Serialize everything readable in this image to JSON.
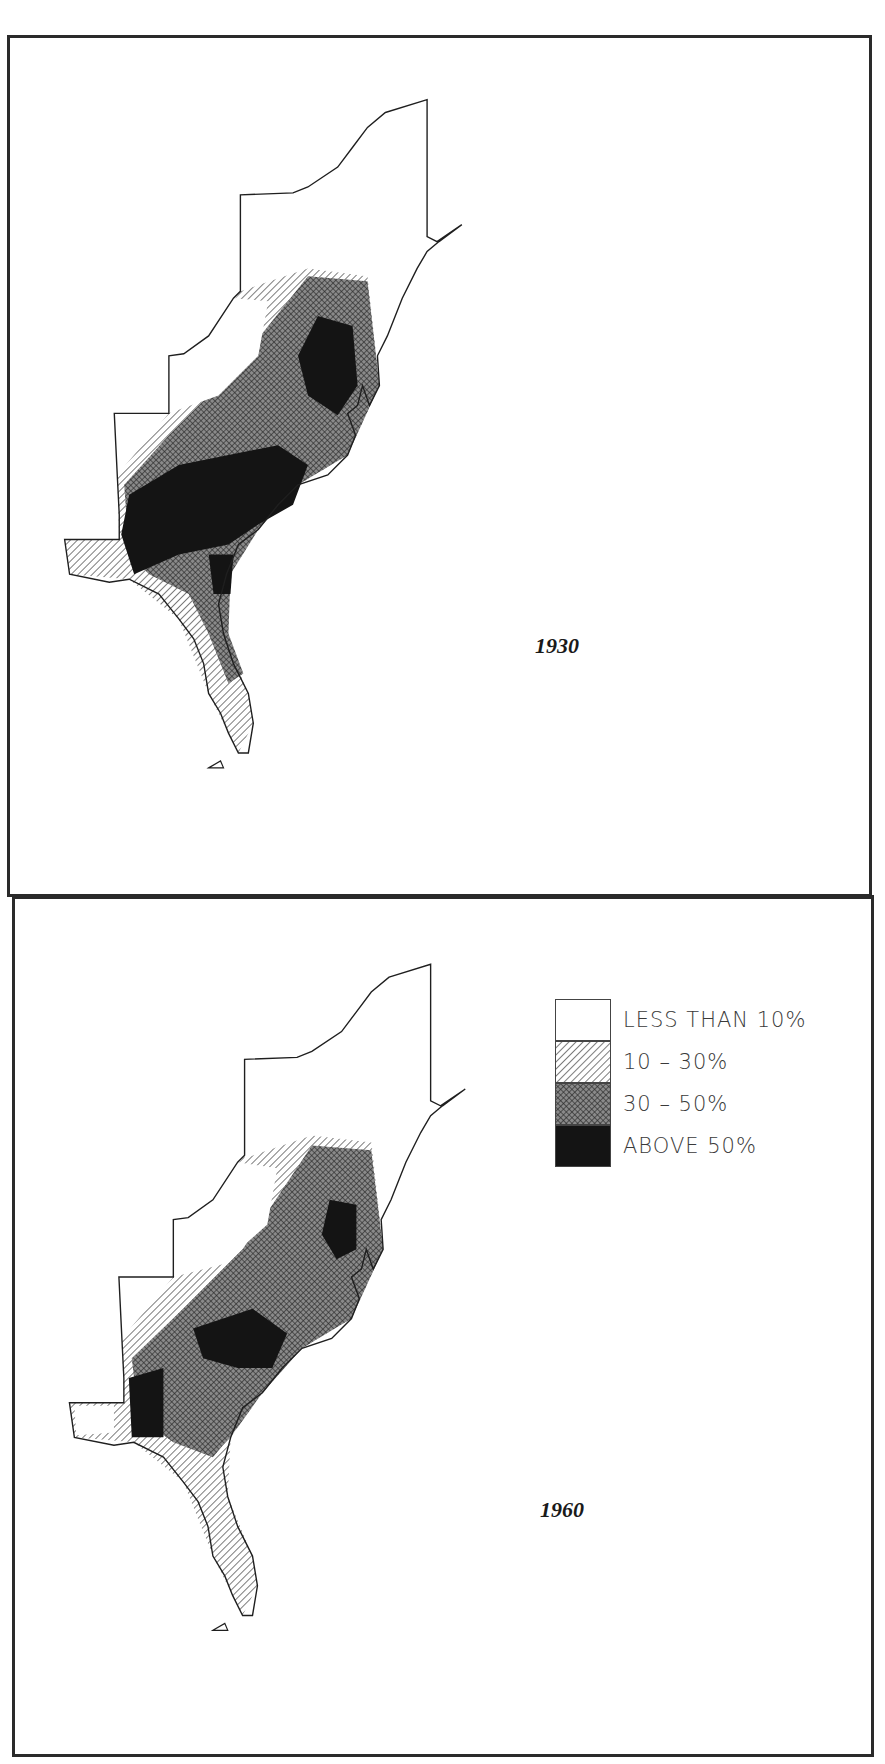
{
  "figure": {
    "panels": [
      {
        "year": "1930"
      },
      {
        "year": "1960"
      }
    ],
    "legend": {
      "items": [
        {
          "label": "LESS THAN 10%",
          "pattern": "blank",
          "color": "#ffffff"
        },
        {
          "label": "10 – 30%",
          "pattern": "diagonal-hatch",
          "color": "#bdbdbd"
        },
        {
          "label": "30 – 50%",
          "pattern": "cross-hatch",
          "color": "#6e6e6e"
        },
        {
          "label": "ABOVE 50%",
          "pattern": "solid",
          "color": "#141414"
        }
      ]
    }
  },
  "colors": {
    "frame": "#2a2a2a",
    "outline": "#1f1f1f",
    "background": "#ffffff"
  }
}
